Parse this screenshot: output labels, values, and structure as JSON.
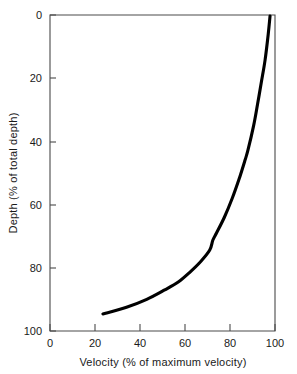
{
  "chart_data": {
    "type": "line",
    "title": "",
    "xlabel": "Velocity (% of maximum velocity)",
    "ylabel": "Depth (% of total depth)",
    "xlim": [
      0,
      100
    ],
    "ylim": [
      0,
      100
    ],
    "y_inverted": true,
    "grid": false,
    "legend": null,
    "xticks": [
      0,
      20,
      40,
      60,
      80,
      100
    ],
    "xtick_labels": [
      "0",
      "20",
      "40",
      "60",
      "80",
      "100"
    ],
    "yticks": [
      0,
      20,
      40,
      60,
      80,
      100
    ],
    "ytick_labels": [
      "0",
      "20",
      "40",
      "60",
      "80",
      "100"
    ],
    "series": [
      {
        "name": "velocity profile",
        "color": "#000000",
        "x": [
          97.8,
          97.0,
          95.6,
          94.0,
          92.3,
          90.5,
          88.0,
          86.7,
          84.0,
          81.0,
          77.5,
          74.0,
          72.4,
          71.0,
          67.0,
          62.0,
          57.0,
          51.0,
          43.0,
          34.0,
          23.5
        ],
        "y": [
          0.3,
          6.0,
          14.2,
          21.0,
          28.0,
          35.0,
          42.7,
          45.9,
          52.0,
          58.0,
          64.0,
          69.0,
          71.2,
          74.4,
          78.0,
          81.5,
          84.5,
          87.0,
          90.0,
          92.5,
          94.6
        ]
      }
    ]
  },
  "axes": {
    "x_label": "Velocity (% of maximum velocity)",
    "y_label": "Depth (% of total depth)"
  },
  "colors": {
    "curve": "#000000",
    "frame": "#4a4a4a",
    "text": "#1a1a1a",
    "background": "#ffffff"
  }
}
